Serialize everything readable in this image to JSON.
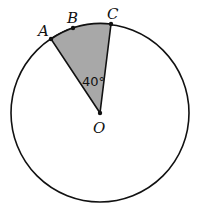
{
  "diagram": {
    "type": "circle-sector",
    "center": {
      "label": "O",
      "x": 100,
      "y": 113
    },
    "radius": 89,
    "points": [
      {
        "label": "A",
        "x": 51,
        "y": 39
      },
      {
        "label": "B",
        "x": 73,
        "y": 28
      },
      {
        "label": "C",
        "x": 111,
        "y": 24
      }
    ],
    "angle_label": "40°",
    "shaded_region": "sector AOC",
    "colors": {
      "shade": "#a8a8a8",
      "stroke": "#111111",
      "background": "#ffffff"
    }
  }
}
